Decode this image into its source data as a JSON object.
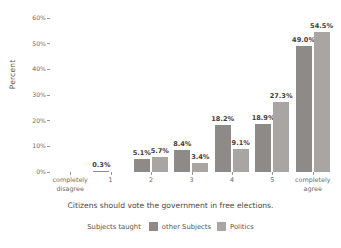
{
  "chart_data": {
    "type": "bar",
    "title": "",
    "xlabel": "Citizens should vote the government in free elections.",
    "ylabel": "Percent",
    "ylim": [
      0,
      60
    ],
    "yticks": [
      "0%",
      "10%",
      "20%",
      "30%",
      "40%",
      "50%",
      "60%"
    ],
    "ytick_values": [
      0,
      10,
      20,
      30,
      40,
      50,
      60
    ],
    "grid": false,
    "legend_title": "Subjects taught",
    "legend_position": "bottom",
    "categories": [
      "completely disagree",
      "1",
      "2",
      "3",
      "4",
      "5",
      "completely agree"
    ],
    "category_lines": [
      [
        "completely",
        "disagree"
      ],
      [
        "1",
        ""
      ],
      [
        "2",
        ""
      ],
      [
        "3",
        ""
      ],
      [
        "4",
        ""
      ],
      [
        "5",
        ""
      ],
      [
        "completely",
        "agree"
      ]
    ],
    "series": [
      {
        "name": "other Subjects",
        "color": "#8d8a87",
        "values": [
          null,
          5.1,
          8.4,
          18.2,
          18.9,
          49.0,
          null
        ],
        "labels": [
          "",
          "5.1%",
          "8.4%",
          "18.2%",
          "18.9%",
          "49.0%",
          ""
        ]
      },
      {
        "name": "Politics",
        "color": "#a8a5a2",
        "values": [
          null,
          5.7,
          3.4,
          9.1,
          27.3,
          54.5,
          null
        ],
        "labels": [
          "",
          "5.7%",
          "3.4%",
          "9.1%",
          "27.3%",
          "54.5%",
          ""
        ]
      }
    ],
    "annotations": [
      {
        "text": "0.3%",
        "category": "1",
        "note": "label for near-zero bar at first numeric tick"
      }
    ],
    "bar_groups": [
      {
        "category": "completely disagree",
        "bars": []
      },
      {
        "category": "1",
        "bars": [
          {
            "series": "other Subjects",
            "value": 0.3,
            "label": "0.3%"
          }
        ]
      },
      {
        "category": "2",
        "bars": [
          {
            "series": "other Subjects",
            "value": 5.1,
            "label": "5.1%"
          },
          {
            "series": "Politics",
            "value": 5.7,
            "label": "5.7%"
          }
        ]
      },
      {
        "category": "3",
        "bars": [
          {
            "series": "other Subjects",
            "value": 8.4,
            "label": "8.4%"
          },
          {
            "series": "Politics",
            "value": 3.4,
            "label": "3.4%"
          }
        ]
      },
      {
        "category": "4",
        "bars": [
          {
            "series": "other Subjects",
            "value": 18.2,
            "label": "18.2%"
          },
          {
            "series": "Politics",
            "value": 9.1,
            "label": "9.1%"
          }
        ]
      },
      {
        "category": "5",
        "bars": [
          {
            "series": "other Subjects",
            "value": 18.9,
            "label": "18.9%"
          },
          {
            "series": "Politics",
            "value": 27.3,
            "label": "27.3%"
          }
        ]
      },
      {
        "category": "completely agree",
        "bars": [
          {
            "series": "other Subjects",
            "value": 49.0,
            "label": "49.0%"
          },
          {
            "series": "Politics",
            "value": 54.5,
            "label": "54.5%"
          }
        ]
      }
    ]
  },
  "colors": {
    "series_other_subjects": "#8d8a87",
    "series_politics": "#a8a5a2",
    "text": "#55524f",
    "tick": "#6d6a67",
    "background": "#ffffff"
  }
}
